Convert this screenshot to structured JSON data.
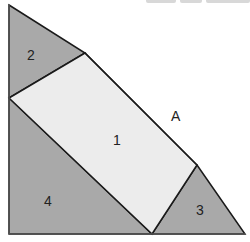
{
  "diagram": {
    "colors": {
      "triangle_fill": "#a9a9a9",
      "rectangle_fill": "#ececec",
      "stroke": "#1a1a1a",
      "label": "#222222",
      "background": "#ffffff"
    },
    "outer_triangle": {
      "vertices": [
        [
          9,
          5
        ],
        [
          9,
          234
        ],
        [
          245,
          234
        ]
      ],
      "label": "A",
      "label_pos": [
        176,
        121
      ]
    },
    "regions": [
      {
        "id": "1",
        "label": "1",
        "shape": "rectangle",
        "vertices": [
          [
            9,
            98
          ],
          [
            85,
            53
          ],
          [
            197,
            165
          ],
          [
            152,
            234
          ]
        ],
        "label_pos": [
          117,
          145
        ]
      },
      {
        "id": "2",
        "label": "2",
        "shape": "triangle",
        "vertices": [
          [
            9,
            5
          ],
          [
            85,
            53
          ],
          [
            9,
            98
          ]
        ],
        "label_pos": [
          32,
          60
        ]
      },
      {
        "id": "3",
        "label": "3",
        "shape": "triangle",
        "vertices": [
          [
            197,
            165
          ],
          [
            245,
            234
          ],
          [
            152,
            234
          ]
        ],
        "label_pos": [
          200,
          215
        ]
      },
      {
        "id": "4",
        "label": "4",
        "shape": "triangle",
        "vertices": [
          [
            9,
            98
          ],
          [
            152,
            234
          ],
          [
            9,
            234
          ]
        ],
        "label_pos": [
          49,
          206
        ]
      }
    ]
  }
}
